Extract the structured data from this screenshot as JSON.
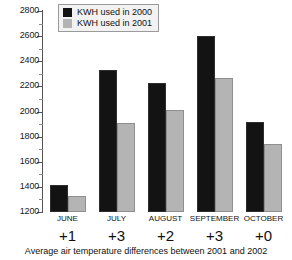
{
  "chart_data": {
    "type": "bar",
    "title": "",
    "categories": [
      "JUNE",
      "JULY",
      "AUGUST",
      "SEPTEMBER",
      "OCTOBER"
    ],
    "series": [
      {
        "name": "KWH used in 2000",
        "color": "#131313",
        "values": [
          1415,
          2330,
          2230,
          2600,
          1920
        ]
      },
      {
        "name": "KWH used in 2001",
        "color": "#b4b4b4",
        "values": [
          1330,
          1905,
          2010,
          2270,
          1740
        ]
      }
    ],
    "xlabel": "",
    "ylabel": "",
    "ylim": [
      1200,
      2800
    ],
    "ytick_labels": [
      "1200",
      "1400",
      "1600",
      "1800",
      "2000",
      "2200",
      "2400",
      "2600",
      "2800"
    ],
    "ytick_values": [
      1200,
      1400,
      1600,
      1800,
      2000,
      2200,
      2400,
      2600,
      2800
    ],
    "yminor_values": [
      1300,
      1500,
      1700,
      1900,
      2100,
      2300,
      2500,
      2700
    ],
    "grid": false,
    "legend_position": "top-left",
    "annotations": {
      "temperature_differences": [
        "+1",
        "+3",
        "+2",
        "+3",
        "+0"
      ],
      "caption": "Average air temperature differences between 2001 and 2002"
    }
  },
  "legend": {
    "items": [
      {
        "label": "KWH used in 2000"
      },
      {
        "label": "KWH used in 2001"
      }
    ]
  },
  "caption": {
    "text": "Average air temperature differences between 2001 and 2002"
  }
}
